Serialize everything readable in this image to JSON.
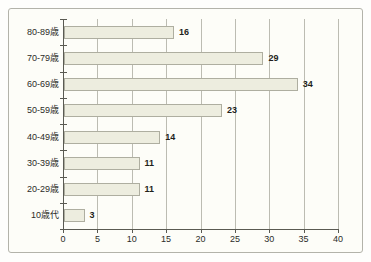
{
  "chart_data": {
    "type": "bar",
    "orientation": "horizontal",
    "title": "",
    "xlabel": "",
    "ylabel": "",
    "categories": [
      "80-89歳",
      "70-79歳",
      "60-69歳",
      "50-59歳",
      "40-49歳",
      "30-39歳",
      "20-29歳",
      "10歳代"
    ],
    "values": [
      16,
      29,
      34,
      23,
      14,
      11,
      11,
      3
    ],
    "data_labels": [
      16,
      29,
      34,
      23,
      14,
      11,
      11,
      3
    ],
    "xlim": [
      0,
      40
    ],
    "xticks": [
      0,
      5,
      10,
      15,
      20,
      25,
      30,
      35,
      40
    ],
    "grid": "vertical",
    "legend": "none",
    "colors": {
      "bar_fill": "#ededdf",
      "bar_border": "#aeaea0",
      "gridline": "#bcbcb2",
      "axis": "#5a5a52",
      "frame_border": "#b3b3aa",
      "background": "#fdfdf8",
      "text": "#2c2c28"
    }
  }
}
